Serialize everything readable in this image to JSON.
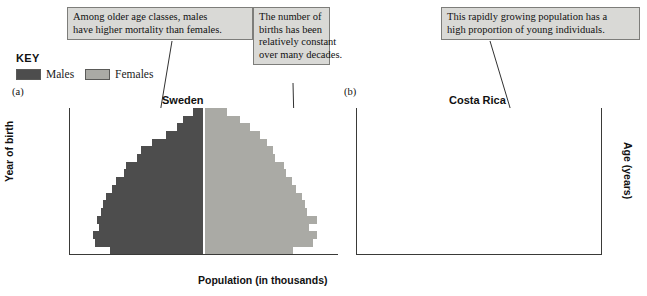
{
  "figure": {
    "xaxis_title": "Population (in thousands)"
  },
  "key": {
    "title": "KEY",
    "males_label": "Males",
    "females_label": "Females",
    "males_color": "#4d4d4d",
    "females_color": "#aaaaa5"
  },
  "callouts": [
    {
      "id": "mortality",
      "lines": [
        "Among older age classes, males",
        "have higher mortality than females."
      ]
    },
    {
      "id": "births",
      "lines": [
        "The number of",
        "births has been",
        "relatively constant",
        "over many decades."
      ]
    },
    {
      "id": "young",
      "lines": [
        "This rapidly growing population has a",
        "high proportion of young individuals."
      ]
    }
  ],
  "panels": [
    {
      "tag": "(a)",
      "title": "Sweden",
      "ylabel": "Year of birth",
      "ytick_labels": [
        "1918",
        "1928",
        "1938",
        "1948",
        "1958",
        "1968",
        "1978",
        "1988",
        "1998",
        "2008"
      ],
      "xtick_labels": [
        "300",
        "200",
        "100",
        "0",
        "100",
        "200",
        "300"
      ]
    },
    {
      "tag": "(b)",
      "title": "Costa Rica",
      "ylabel": "Age (years)",
      "ytick_labels": [
        "90",
        "70",
        "50",
        "30",
        "10"
      ],
      "xtick_labels": [
        "200",
        "100",
        "0",
        "100",
        "200"
      ]
    }
  ],
  "chart_data": [
    {
      "type": "bar",
      "chart_style": "population-pyramid",
      "title": "Sweden",
      "xlabel": "Population (in thousands)",
      "ylabel": "Year of birth",
      "xlim": [
        -350,
        350
      ],
      "xticks": [
        -300,
        -200,
        -100,
        0,
        100,
        200,
        300
      ],
      "xtick_labels": [
        "300",
        "200",
        "100",
        "0",
        "100",
        "200",
        "300"
      ],
      "yticks": [
        1918,
        1928,
        1938,
        1948,
        1958,
        1968,
        1978,
        1988,
        1998,
        2008
      ],
      "grid": true,
      "grid_axis": "y",
      "age_groups": [
        "90+",
        "85-89",
        "80-84",
        "75-79",
        "70-74",
        "65-69",
        "60-64",
        "55-59",
        "50-54",
        "45-49",
        "40-44",
        "35-39",
        "30-34",
        "25-29",
        "20-24",
        "15-19",
        "10-14",
        "5-9",
        "0-4"
      ],
      "birth_year_bins": [
        "1918",
        "1923",
        "1928",
        "1933",
        "1938",
        "1943",
        "1948",
        "1953",
        "1958",
        "1963",
        "1968",
        "1973",
        "1978",
        "1983",
        "1988",
        "1993",
        "1998",
        "2003",
        "2008"
      ],
      "series": [
        {
          "name": "Males",
          "color": "#4d4d4d",
          "values": [
            30,
            55,
            70,
            100,
            135,
            165,
            175,
            205,
            210,
            230,
            240,
            255,
            265,
            270,
            280,
            275,
            290,
            285,
            245
          ]
        },
        {
          "name": "Females",
          "color": "#aaaaa5",
          "values": [
            60,
            95,
            120,
            145,
            165,
            180,
            185,
            210,
            215,
            230,
            240,
            255,
            265,
            270,
            295,
            275,
            295,
            285,
            232
          ]
        }
      ]
    },
    {
      "type": "bar",
      "chart_style": "population-pyramid",
      "title": "Costa Rica",
      "xlabel": "Population (in thousands)",
      "ylabel": "Age (years)",
      "xlim": [
        -260,
        260
      ],
      "xticks": [
        -200,
        -100,
        0,
        100,
        200
      ],
      "xtick_labels": [
        "200",
        "100",
        "0",
        "100",
        "200"
      ],
      "yticks": [
        10,
        30,
        50,
        70,
        90
      ],
      "grid": true,
      "grid_axis": "y",
      "age_groups": [
        "90+",
        "85-89",
        "80-84",
        "75-79",
        "70-74",
        "65-69",
        "60-64",
        "55-59",
        "50-54",
        "45-49",
        "40-44",
        "35-39",
        "30-34",
        "25-29",
        "20-24",
        "15-19",
        "10-14",
        "5-9",
        "0-4"
      ],
      "series": [
        {
          "name": "Males",
          "color": "#4d4d4d",
          "values": [
            5,
            10,
            17,
            25,
            35,
            48,
            60,
            72,
            85,
            98,
            112,
            125,
            140,
            152,
            168,
            183,
            190,
            188,
            188
          ]
        },
        {
          "name": "Females",
          "color": "#aaaaa5",
          "values": [
            8,
            14,
            22,
            30,
            42,
            55,
            66,
            78,
            90,
            103,
            116,
            128,
            142,
            155,
            170,
            185,
            190,
            185,
            180
          ]
        }
      ]
    }
  ]
}
